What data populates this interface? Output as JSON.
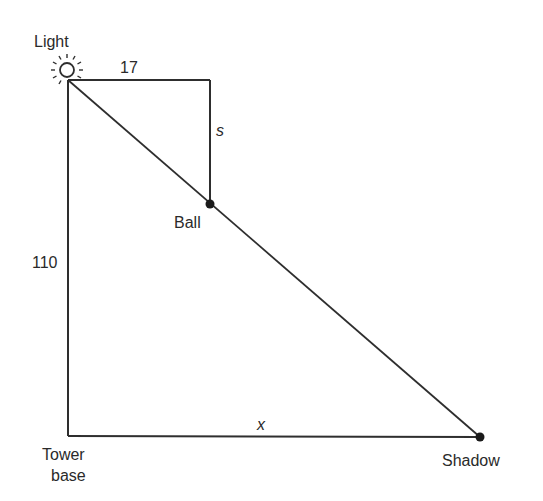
{
  "diagram": {
    "type": "similar-triangles",
    "labels": {
      "light": "Light",
      "top_length": "17",
      "s": "s",
      "ball": "Ball",
      "height": "110",
      "x": "x",
      "tower_base_line1": "Tower",
      "tower_base_line2": "base",
      "shadow": "Shadow"
    },
    "icons": {
      "light": "light-bulb-icon",
      "ball": "filled-dot",
      "shadow": "filled-dot"
    },
    "colors": {
      "line": "#2e2e2e",
      "text": "#2a2a2a",
      "background": "#ffffff"
    }
  }
}
